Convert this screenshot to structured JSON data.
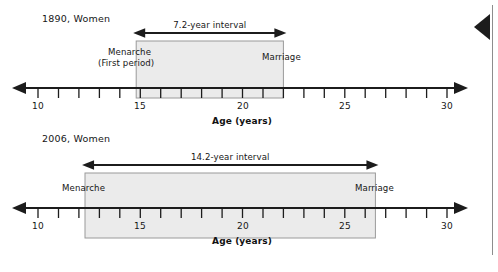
{
  "chart_data": {
    "type": "table",
    "xlabel": "Age (years)",
    "xlim": [
      10,
      30
    ],
    "tick_labels": [
      "10",
      "15",
      "20",
      "25",
      "30"
    ],
    "tick_values": [
      10,
      15,
      20,
      25,
      30
    ],
    "minor_tick_step": 1,
    "grid": false,
    "legend": "none",
    "panels": [
      {
        "id": "1890",
        "title": "1890, Women",
        "interval_label": "7.2-year interval",
        "interval_years": 7.2,
        "start_label": "Menarche",
        "start_sublabel": "(First period)",
        "start_age": 14.8,
        "end_label": "Marriage",
        "end_age": 22.0,
        "axis_title": "Age (years)"
      },
      {
        "id": "2006",
        "title": "2006, Women",
        "interval_label": "14.2-year interval",
        "interval_years": 14.2,
        "start_label": "Menarche",
        "start_sublabel": "",
        "start_age": 12.3,
        "end_label": "Marriage",
        "end_age": 26.5,
        "axis_title": "Age (years)"
      }
    ]
  },
  "colors": {
    "band_fill": "#ebebeb",
    "band_stroke": "#9a9a9a",
    "axis": "#1c1c1c",
    "text": "#161616",
    "scroll_rail": "#8d8d8d",
    "scroll_marker": "#1c1c1c"
  },
  "scroll": {
    "marker_name": "scroll-position-marker"
  }
}
